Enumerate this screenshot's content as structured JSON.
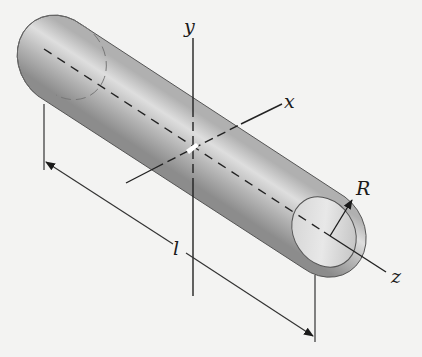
{
  "figure": {
    "background": "#f3f3f2",
    "colors": {
      "cylinder_dark": "#8a8a8a",
      "cylinder_light": "#e6e6e6",
      "line": "#222222"
    },
    "labels": {
      "y_axis": "y",
      "x_axis": "x",
      "z_axis": "z",
      "radius": "R",
      "length": "l"
    }
  }
}
